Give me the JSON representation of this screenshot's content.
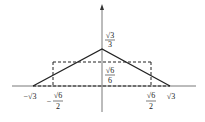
{
  "diagram": {
    "axes": {
      "x_axis": true,
      "y_axis": true,
      "y_arrow": true
    },
    "triangle": {
      "vertices": [
        "(-√3, 0)",
        "(0, √3/3)",
        "(√3, 0)"
      ],
      "style": "solid"
    },
    "rectangle": {
      "x_range": [
        "-√6/2",
        "√6/2"
      ],
      "height": "√6/6",
      "style": "dashed"
    },
    "labels": {
      "apex": {
        "num": "√3",
        "den": "3"
      },
      "rect_height": {
        "num": "√6",
        "den": "6"
      },
      "neg_root3": "−√3",
      "neg_root6_half": {
        "sign": "−",
        "num": "√6",
        "den": "2"
      },
      "root6_half": {
        "num": "√6",
        "den": "2"
      },
      "root3": "√3"
    },
    "colors": {
      "line": "#222222",
      "background": "#ffffff"
    }
  }
}
